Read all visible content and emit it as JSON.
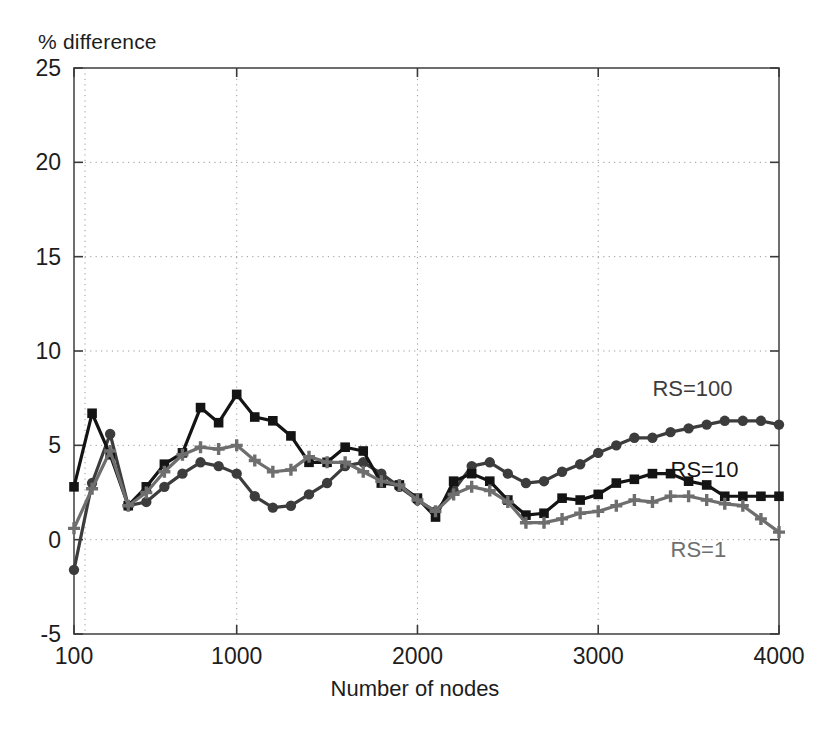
{
  "chart_data": {
    "type": "line",
    "title": "",
    "ylabel": "% difference",
    "xlabel": "Number of nodes",
    "xlim": [
      100,
      4000
    ],
    "ylim": [
      -5,
      25
    ],
    "xticks": [
      100,
      1000,
      2000,
      3000,
      4000
    ],
    "xticklabels": [
      "100",
      "1000",
      "2000",
      "3000",
      "4000"
    ],
    "yticks": [
      -5,
      0,
      5,
      10,
      15,
      20,
      25
    ],
    "yticklabels": [
      "-5",
      "0",
      "5",
      "10",
      "15",
      "20",
      "25"
    ],
    "grid": true,
    "grid_style": "dotted",
    "legend_position": "inline-right",
    "series": [
      {
        "name": "RS=100",
        "color": "#3c3c3c",
        "marker": "circle",
        "label_x": 3300,
        "label_y": 7.6,
        "x": [
          100,
          200,
          300,
          400,
          500,
          600,
          700,
          800,
          900,
          1000,
          1100,
          1200,
          1300,
          1400,
          1500,
          1600,
          1700,
          1800,
          1900,
          2000,
          2100,
          2200,
          2300,
          2400,
          2500,
          2600,
          2700,
          2800,
          2900,
          3000,
          3100,
          3200,
          3300,
          3400,
          3500,
          3600,
          3700,
          3800,
          3900,
          4000
        ],
        "y": [
          -1.6,
          3.0,
          5.6,
          1.8,
          2.0,
          2.8,
          3.5,
          4.1,
          3.9,
          3.5,
          2.3,
          1.7,
          1.8,
          2.4,
          3.0,
          3.9,
          4.1,
          3.5,
          2.8,
          2.1,
          1.5,
          2.6,
          3.9,
          4.1,
          3.5,
          3.0,
          3.1,
          3.6,
          4.0,
          4.6,
          5.0,
          5.4,
          5.4,
          5.7,
          5.9,
          6.1,
          6.3,
          6.3,
          6.3,
          6.1
        ]
      },
      {
        "name": "RS=10",
        "color": "#141414",
        "marker": "square",
        "label_x": 3400,
        "label_y": 3.3,
        "x": [
          100,
          200,
          300,
          400,
          500,
          600,
          700,
          800,
          900,
          1000,
          1100,
          1200,
          1300,
          1400,
          1500,
          1600,
          1700,
          1800,
          1900,
          2000,
          2100,
          2200,
          2300,
          2400,
          2500,
          2600,
          2700,
          2800,
          2900,
          3000,
          3100,
          3200,
          3300,
          3400,
          3500,
          3600,
          3700,
          3800,
          3900,
          4000
        ],
        "y": [
          2.8,
          6.7,
          4.5,
          1.8,
          2.8,
          4.0,
          4.6,
          7.0,
          6.2,
          7.7,
          6.5,
          6.3,
          5.5,
          4.1,
          4.1,
          4.9,
          4.7,
          3.0,
          2.9,
          2.2,
          1.2,
          3.1,
          3.5,
          3.1,
          2.1,
          1.3,
          1.4,
          2.2,
          2.1,
          2.4,
          3.0,
          3.2,
          3.5,
          3.5,
          3.1,
          2.9,
          2.3,
          2.3,
          2.3,
          2.3
        ]
      },
      {
        "name": "RS=1",
        "color": "#6e6e6e",
        "marker": "plus",
        "label_x": 3400,
        "label_y": -0.9,
        "x": [
          100,
          200,
          300,
          400,
          500,
          600,
          700,
          800,
          900,
          1000,
          1100,
          1200,
          1300,
          1400,
          1500,
          1600,
          1700,
          1800,
          1900,
          2000,
          2100,
          2200,
          2300,
          2400,
          2500,
          2600,
          2700,
          2800,
          2900,
          3000,
          3100,
          3200,
          3300,
          3400,
          3500,
          3600,
          3700,
          3800,
          3900,
          4000
        ],
        "y": [
          0.6,
          2.7,
          4.7,
          1.8,
          2.5,
          3.6,
          4.5,
          4.9,
          4.8,
          5.0,
          4.2,
          3.6,
          3.7,
          4.4,
          4.1,
          4.1,
          3.6,
          3.1,
          2.9,
          2.1,
          1.5,
          2.4,
          2.8,
          2.6,
          2.0,
          0.9,
          0.9,
          1.1,
          1.4,
          1.5,
          1.8,
          2.1,
          2.0,
          2.3,
          2.3,
          2.1,
          1.9,
          1.8,
          1.1,
          0.4
        ]
      }
    ]
  }
}
